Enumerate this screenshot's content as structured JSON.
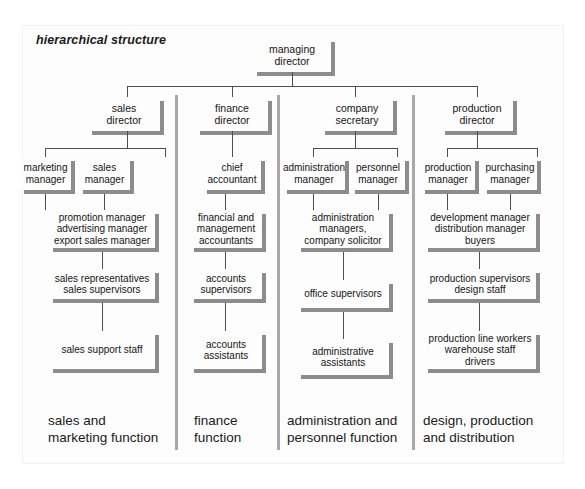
{
  "figure": {
    "title": "hierarchical structure",
    "colors": {
      "page_background": "#ffffff",
      "node_face": "#fdfdfd",
      "node_shadow": "#8c8c8c",
      "connector_line": "#4d4d4d",
      "column_divider": "#a8a8a8",
      "text": "#151515"
    }
  },
  "root": {
    "label": "managing\ndirector"
  },
  "columns": [
    {
      "name": "sales-and-marketing",
      "director": {
        "label": "sales\ndirector"
      },
      "managers": [
        {
          "label": "marketing\nmanager"
        },
        {
          "label": "sales\nmanager"
        }
      ],
      "levels": [
        {
          "label": "promotion manager\nadvertising manager\nexport sales manager"
        },
        {
          "label": "sales representatives\nsales supervisors"
        },
        {
          "label": "sales support staff"
        }
      ],
      "function_label": "sales and\nmarketing function"
    },
    {
      "name": "finance",
      "director": {
        "label": "finance\ndirector"
      },
      "managers": [
        {
          "label": "chief\naccountant"
        }
      ],
      "levels": [
        {
          "label": "financial and\nmanagement\naccountants"
        },
        {
          "label": "accounts\nsupervisors"
        },
        {
          "label": "accounts\nassistants"
        }
      ],
      "function_label": "finance\nfunction"
    },
    {
      "name": "administration-and-personnel",
      "director": {
        "label": "company\nsecretary"
      },
      "managers": [
        {
          "label": "administration\nmanager"
        },
        {
          "label": "personnel\nmanager"
        }
      ],
      "levels": [
        {
          "label": "administration\nmanagers,\ncompany solicitor"
        },
        {
          "label": "office supervisors"
        },
        {
          "label": "administrative\nassistants"
        }
      ],
      "function_label": "administration and\npersonnel function"
    },
    {
      "name": "design-production-and-distribution",
      "director": {
        "label": "production\ndirector"
      },
      "managers": [
        {
          "label": "production\nmanager"
        },
        {
          "label": "purchasing\nmanager"
        }
      ],
      "levels": [
        {
          "label": "development manager\ndistribution manager\nbuyers"
        },
        {
          "label": "production supervisors\ndesign staff"
        },
        {
          "label": "production line workers\nwarehouse staff\ndrivers"
        }
      ],
      "function_label": "design, production\nand distribution"
    }
  ]
}
